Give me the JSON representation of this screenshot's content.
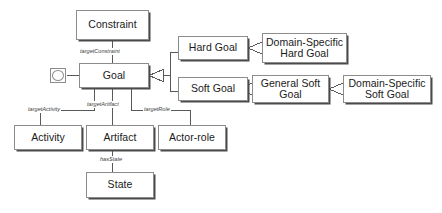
{
  "diagram": {
    "type": "uml-class-diagram",
    "background_color": "#ffffff",
    "line_color": "#595959",
    "box_border_color": "#8c8c8c",
    "box_fill_color": "#ffffff",
    "text_color": "#1a1a1a",
    "nodes": [
      {
        "id": "constraint",
        "label": "Constraint"
      },
      {
        "id": "goal",
        "label": "Goal"
      },
      {
        "id": "hard_goal",
        "label": "Hard Goal"
      },
      {
        "id": "soft_goal",
        "label": "Soft Goal"
      },
      {
        "id": "domain_specific_hard",
        "label": "Domain-Specific\nHard Goal"
      },
      {
        "id": "general_soft",
        "label": "General Soft\nGoal"
      },
      {
        "id": "domain_specific_soft",
        "label": "Domain-Specific\nSoft Goal"
      },
      {
        "id": "activity",
        "label": "Activity"
      },
      {
        "id": "artifact",
        "label": "Artifact"
      },
      {
        "id": "actor_role",
        "label": "Actor-role"
      },
      {
        "id": "state",
        "label": "State"
      }
    ],
    "edge_labels": [
      {
        "id": "target_constraint",
        "label": "targetConstraint",
        "from": "goal",
        "to": "constraint"
      },
      {
        "id": "target_activity",
        "label": "targetActivity",
        "from": "goal",
        "to": "activity"
      },
      {
        "id": "target_artifact",
        "label": "targetArtifact",
        "from": "goal",
        "to": "artifact"
      },
      {
        "id": "target_role",
        "label": "targetRole",
        "from": "goal",
        "to": "actor_role"
      },
      {
        "id": "has_state",
        "label": "hasState",
        "from": "artifact",
        "to": "state"
      }
    ],
    "generalizations": [
      {
        "from": "hard_goal",
        "to": "goal"
      },
      {
        "from": "soft_goal",
        "to": "goal"
      },
      {
        "from": "domain_specific_hard",
        "to": "hard_goal"
      },
      {
        "from": "general_soft",
        "to": "soft_goal"
      },
      {
        "from": "domain_specific_soft",
        "to": "general_soft"
      }
    ],
    "self_reference": {
      "id": "goal-self-reference",
      "icon": "square-circle-icon"
    }
  }
}
